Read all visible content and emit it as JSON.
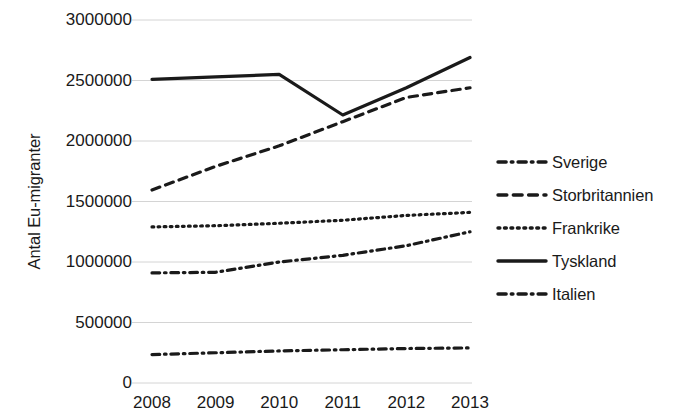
{
  "chart_data": {
    "type": "line",
    "title": "",
    "xlabel": "",
    "ylabel": "Antal Eu-migranter",
    "categories": [
      "2008",
      "2009",
      "2010",
      "2011",
      "2012",
      "2013"
    ],
    "ylim": [
      0,
      3000000
    ],
    "ytick_step": 500000,
    "yticks": [
      "3000000",
      "2500000",
      "2000000",
      "1500000",
      "1000000",
      "500000",
      "0"
    ],
    "ytick_values": [
      3000000,
      2500000,
      2000000,
      1500000,
      1000000,
      500000,
      0
    ],
    "grid": "horizontal",
    "legend_position": "right",
    "series": [
      {
        "name": "Sverige",
        "style": "dash-dot",
        "color": "#1a1a1a",
        "values": [
          235000,
          250000,
          265000,
          275000,
          285000,
          290000
        ]
      },
      {
        "name": "Storbritannien",
        "style": "dashed",
        "color": "#1a1a1a",
        "values": [
          1595000,
          1790000,
          1960000,
          2160000,
          2360000,
          2440000
        ]
      },
      {
        "name": "Frankrike",
        "style": "dotted",
        "color": "#1a1a1a",
        "values": [
          1290000,
          1300000,
          1320000,
          1345000,
          1385000,
          1410000
        ]
      },
      {
        "name": "Tyskland",
        "style": "solid",
        "color": "#1a1a1a",
        "values": [
          2510000,
          2530000,
          2550000,
          2215000,
          2440000,
          2690000
        ]
      },
      {
        "name": "Italien",
        "style": "dash-dot",
        "color": "#1a1a1a",
        "values": [
          910000,
          915000,
          1000000,
          1055000,
          1135000,
          1250000
        ]
      }
    ]
  }
}
